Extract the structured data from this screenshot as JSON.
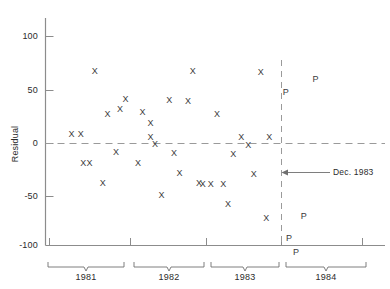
{
  "chart_data": {
    "type": "scatter",
    "title": "",
    "xlabel": "",
    "ylabel": "Residual",
    "ylim": [
      -100,
      120
    ],
    "yticks": [
      -100,
      -50,
      0,
      50,
      100
    ],
    "ytick_labels": [
      "-100",
      "-50",
      "0",
      "50",
      "100"
    ],
    "xlim": [
      1981.0,
      1985.0
    ],
    "xticks": [
      1981.0,
      1982.0,
      1983.0,
      1984.0,
      1985.0
    ],
    "xtick_labels": [
      "",
      "",
      "",
      "",
      ""
    ],
    "x_group_labels": [
      "1981",
      "1982",
      "1983",
      "1984"
    ],
    "grid": false,
    "legend": null,
    "zero_reference_line": {
      "value": 0,
      "style": "dashed"
    },
    "vertical_reference_line": {
      "value": 1984.0,
      "style": "dashed",
      "label": "Dec. 1983"
    },
    "annotations": [
      {
        "text": "Dec. 1983",
        "x": 1984.0,
        "y": -28,
        "arrow": true
      }
    ],
    "series": [
      {
        "name": "Residual (X)",
        "marker": "X",
        "points": [
          {
            "x": 1981.58,
            "y": 68
          },
          {
            "x": 1981.74,
            "y": 28
          },
          {
            "x": 1981.9,
            "y": 33
          },
          {
            "x": 1981.97,
            "y": 42
          },
          {
            "x": 1981.28,
            "y": 9
          },
          {
            "x": 1981.4,
            "y": 9
          },
          {
            "x": 1981.85,
            "y": -8
          },
          {
            "x": 1981.43,
            "y": -18
          },
          {
            "x": 1981.51,
            "y": -18
          },
          {
            "x": 1981.68,
            "y": -37
          },
          {
            "x": 1982.83,
            "y": 68
          },
          {
            "x": 1982.53,
            "y": 41
          },
          {
            "x": 1982.77,
            "y": 40
          },
          {
            "x": 1982.19,
            "y": 30
          },
          {
            "x": 1982.29,
            "y": 19
          },
          {
            "x": 1982.29,
            "y": 6
          },
          {
            "x": 1982.35,
            "y": 0
          },
          {
            "x": 1982.59,
            "y": -9
          },
          {
            "x": 1982.13,
            "y": -18
          },
          {
            "x": 1982.66,
            "y": -28
          },
          {
            "x": 1982.91,
            "y": -37
          },
          {
            "x": 1982.43,
            "y": -49
          },
          {
            "x": 1983.7,
            "y": 67
          },
          {
            "x": 1983.14,
            "y": 28
          },
          {
            "x": 1983.45,
            "y": 6
          },
          {
            "x": 1983.54,
            "y": -1
          },
          {
            "x": 1983.81,
            "y": 6
          },
          {
            "x": 1983.35,
            "y": -10
          },
          {
            "x": 1983.61,
            "y": -29
          },
          {
            "x": 1982.96,
            "y": -38
          },
          {
            "x": 1983.06,
            "y": -38
          },
          {
            "x": 1983.22,
            "y": -38
          },
          {
            "x": 1983.28,
            "y": -57
          },
          {
            "x": 1983.77,
            "y": -70
          }
        ]
      },
      {
        "name": "Prediction (P)",
        "marker": "P",
        "points": [
          {
            "x": 1984.4,
            "y": 61
          },
          {
            "x": 1984.02,
            "y": 49
          },
          {
            "x": 1984.25,
            "y": -68
          },
          {
            "x": 1984.06,
            "y": -89
          },
          {
            "x": 1984.15,
            "y": -102
          }
        ]
      }
    ]
  },
  "axis": {
    "y_title": "Residual"
  }
}
